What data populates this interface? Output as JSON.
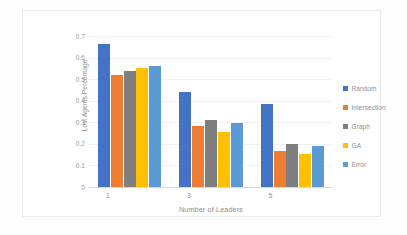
{
  "chart_data": {
    "type": "bar",
    "title": "",
    "xlabel": "Number of Leaders",
    "ylabel": "Lost Agents Percentage",
    "categories": [
      "1",
      "3",
      "5"
    ],
    "ylim": [
      0,
      0.7
    ],
    "yticks": [
      "0",
      "0.1",
      "0.2",
      "0.3",
      "0.4",
      "0.5",
      "0.6",
      "0.7"
    ],
    "ytick_values": [
      0,
      0.1,
      0.2,
      0.3,
      0.4,
      0.5,
      0.6,
      0.7
    ],
    "grid": true,
    "legend_position": "right",
    "series": [
      {
        "name": "Random",
        "color": "#4472c4",
        "values": [
          0.665,
          0.44,
          0.385
        ]
      },
      {
        "name": "Intersection",
        "color": "#ed7d31",
        "values": [
          0.52,
          0.285,
          0.165
        ]
      },
      {
        "name": "Graph",
        "color": "#7f7f7f",
        "values": [
          0.54,
          0.31,
          0.2
        ]
      },
      {
        "name": "GA",
        "color": "#ffc000",
        "values": [
          0.55,
          0.255,
          0.155
        ]
      },
      {
        "name": "Error",
        "color": "#5b9bd5",
        "values": [
          0.56,
          0.295,
          0.19
        ]
      }
    ]
  }
}
